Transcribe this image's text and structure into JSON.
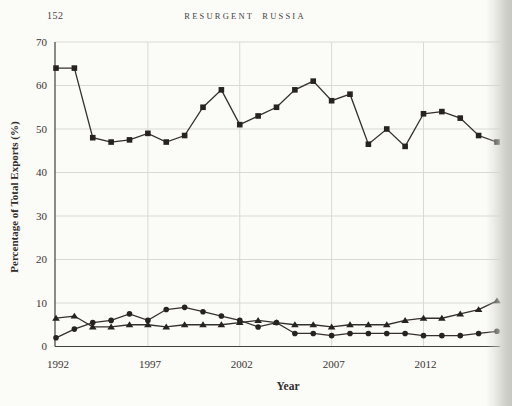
{
  "page": {
    "page_number": "152",
    "running_title": "RESURGENT RUSSIA"
  },
  "colors": {
    "background": "#fbfbf8",
    "grid": "#dadad4",
    "axis": "#44403c",
    "line": "#34302d",
    "marker": "#262321",
    "text": "#3a3531",
    "page_edge_shadow": "#c7c7c1"
  },
  "chart_data": {
    "type": "line",
    "title": "",
    "xlabel": "Year",
    "ylabel": "Percentage of Total Exports (%)",
    "xlim": [
      1992,
      2016
    ],
    "ylim": [
      0,
      70
    ],
    "xticks": [
      1992,
      1997,
      2002,
      2007,
      2012
    ],
    "yticks": [
      0,
      10,
      20,
      30,
      40,
      50,
      60,
      70
    ],
    "grid": true,
    "legend": "none",
    "x": [
      1992,
      1993,
      1994,
      1995,
      1996,
      1997,
      1998,
      1999,
      2000,
      2001,
      2002,
      2003,
      2004,
      2005,
      2006,
      2007,
      2008,
      2009,
      2010,
      2011,
      2012,
      2013,
      2014,
      2015,
      2016
    ],
    "series": [
      {
        "name": "square-series",
        "marker": "square",
        "values": [
          64,
          64,
          48,
          47,
          47.5,
          49,
          47,
          48.5,
          55,
          59,
          51,
          53,
          55,
          59,
          61,
          56.5,
          58,
          46.5,
          50,
          46,
          53.5,
          54,
          52.5,
          48.5,
          47
        ]
      },
      {
        "name": "triangle-series",
        "marker": "triangle",
        "values": [
          6.5,
          7,
          4.5,
          4.5,
          5,
          5,
          4.5,
          5,
          5,
          5,
          5.5,
          6,
          5.5,
          5,
          5,
          4.5,
          5,
          5,
          5,
          6,
          6.5,
          6.5,
          7.5,
          8.5,
          10.5
        ]
      },
      {
        "name": "circle-series",
        "marker": "circle",
        "values": [
          2,
          4,
          5.5,
          6,
          7.5,
          6,
          8.5,
          9,
          8,
          7,
          6,
          4.5,
          5.5,
          3,
          3,
          2.5,
          3,
          3,
          3,
          3,
          2.5,
          2.5,
          2.5,
          3,
          3.5
        ]
      }
    ]
  }
}
